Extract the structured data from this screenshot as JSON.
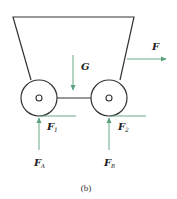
{
  "figure": {
    "caption": "(b)",
    "colors": {
      "outline": "#333333",
      "force_arrow": "#5aa07a",
      "text": "#222222"
    },
    "labels": {
      "gravity": {
        "main": "G",
        "sub": ""
      },
      "applied_force": {
        "main": "F",
        "sub": ""
      },
      "friction_front": {
        "main": "F",
        "sub": "1"
      },
      "friction_rear": {
        "main": "F",
        "sub": "2"
      },
      "normal_front": {
        "main": "F",
        "sub": "A"
      },
      "normal_rear": {
        "main": "F",
        "sub": "B"
      }
    },
    "components": [
      "cart-body-trapezoid",
      "left-wheel",
      "right-wheel",
      "axle-link"
    ]
  }
}
